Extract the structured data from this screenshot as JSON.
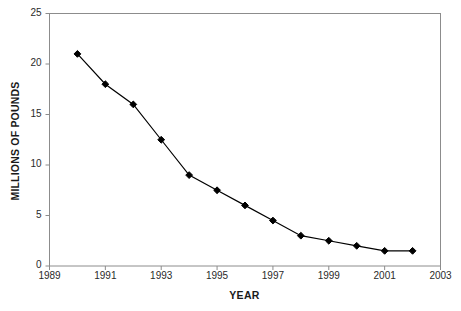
{
  "clipped_caption": "",
  "chart_data": {
    "type": "line",
    "title": "",
    "xlabel": "YEAR",
    "ylabel": "MILLIONS OF POUNDS",
    "xlim": [
      1989,
      2003
    ],
    "ylim": [
      0,
      25
    ],
    "grid": false,
    "legend": "none",
    "x_tick_labels": [
      "1989",
      "1991",
      "1993",
      "1995",
      "1997",
      "1999",
      "2001",
      "2003"
    ],
    "x_tick_values": [
      1989,
      1991,
      1993,
      1995,
      1997,
      1999,
      2001,
      2003
    ],
    "y_tick_labels": [
      "0",
      "5",
      "10",
      "15",
      "20",
      "25"
    ],
    "y_tick_values": [
      0,
      5,
      10,
      15,
      20,
      25
    ],
    "marker": "diamond",
    "marker_color": "#000000",
    "line_color": "#000000",
    "x": [
      1990,
      1991,
      1992,
      1993,
      1994,
      1995,
      1996,
      1997,
      1998,
      1999,
      2000,
      2001,
      2002
    ],
    "values": [
      21,
      18,
      16,
      12.5,
      9,
      7.5,
      6,
      4.5,
      3,
      2.5,
      2,
      1.5,
      1.5
    ],
    "series": [
      {
        "name": "",
        "values": [
          21,
          18,
          16,
          12.5,
          9,
          7.5,
          6,
          4.5,
          3,
          2.5,
          2,
          1.5,
          1.5
        ]
      }
    ]
  }
}
